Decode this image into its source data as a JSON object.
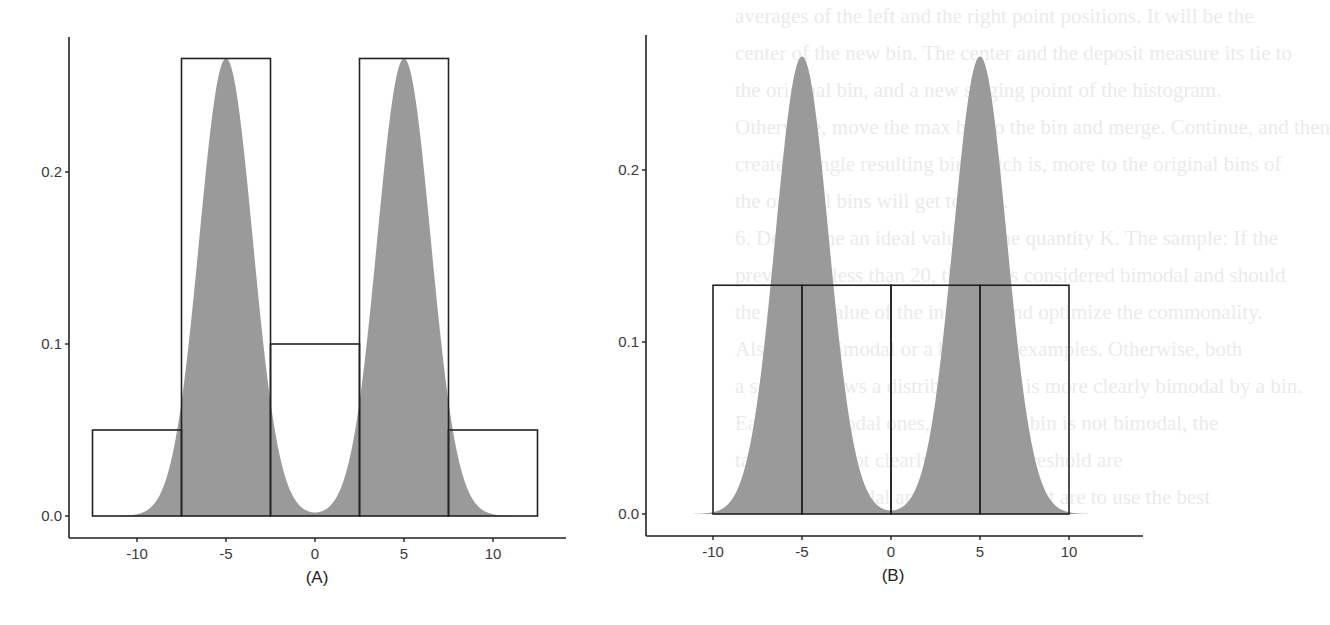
{
  "background_text": [
    "averages of the left and the right point positions. It will be the",
    "center of the new bin. The center and the deposit measure its tie to",
    "the original bin, and a new staging point of the histogram.",
    "Otherwise, move the max bin to the bin and merge. Continue, and then",
    "create a single resulting bin which is, more to the original bins of",
    "the original bins will get to zero.",
    "6.  Determine an ideal value of the quantity K. The sample: If the",
    "    prevalue is less than 20, the bin is considered bimodal and should",
    "    the modal value of the interval, and optimize the commonality.",
    "    Also, the unimodal or a bin of 11 examples. Otherwise, both",
    "    a section shows a distribution that is more clearly bimodal by a bin.",
    "    Earlier, unimodal ones, the overall bin is not bimodal, the",
    "    tails that are not clearly, then the threshold are",
    "    the bin, can modal approximation that are to use the best"
  ],
  "chart_data": [
    {
      "type": "area+histogram",
      "panel_label": "(A)",
      "description": "Bimodal density (two Gaussians at -5 and 5) overlaid with variable-width histogram bins",
      "xlabel": "",
      "ylabel": "",
      "x_ticks": [
        -10,
        -5,
        0,
        5,
        10
      ],
      "y_ticks": [
        "0.0",
        "0.1",
        "0.2"
      ],
      "xlim": [
        -13.5,
        14
      ],
      "ylim": [
        -0.013,
        0.278
      ],
      "grid": false,
      "density": {
        "modes": [
          -5,
          5
        ],
        "peak": 0.266,
        "sd": 1.5,
        "fill": "#9a9a9a"
      },
      "bins": [
        {
          "x0": -12.5,
          "x1": -7.5,
          "height": 0.05
        },
        {
          "x0": -7.5,
          "x1": -2.5,
          "height": 0.266
        },
        {
          "x0": -2.5,
          "x1": 2.5,
          "height": 0.1
        },
        {
          "x0": 2.5,
          "x1": 7.5,
          "height": 0.266
        },
        {
          "x0": 7.5,
          "x1": 12.5,
          "height": 0.05
        }
      ]
    },
    {
      "type": "area+histogram",
      "panel_label": "(B)",
      "description": "Same bimodal density overlaid with equal-width histogram bins",
      "xlabel": "",
      "ylabel": "",
      "x_ticks": [
        -10,
        -5,
        0,
        5,
        10
      ],
      "y_ticks": [
        "0.0",
        "0.1",
        "0.2"
      ],
      "xlim": [
        -13.5,
        14
      ],
      "ylim": [
        -0.013,
        0.278
      ],
      "grid": false,
      "density": {
        "modes": [
          -5,
          5
        ],
        "peak": 0.266,
        "sd": 1.5,
        "fill": "#9a9a9a"
      },
      "bins": [
        {
          "x0": -10,
          "x1": -5,
          "height": 0.133
        },
        {
          "x0": -5,
          "x1": 0,
          "height": 0.133
        },
        {
          "x0": 0,
          "x1": 5,
          "height": 0.133
        },
        {
          "x0": 5,
          "x1": 10,
          "height": 0.133
        }
      ]
    }
  ],
  "layout": {
    "panels": [
      {
        "yaxis_x": 69,
        "xaxis_y": 538,
        "y_top": 37,
        "x_end": 566,
        "x0_px": 315,
        "px_per_unit_x": 17.8,
        "y0_px": 516,
        "px_per_unit_y": 1720
      },
      {
        "yaxis_x": 646,
        "xaxis_y": 536,
        "y_top": 35,
        "x_end": 1143,
        "x0_px": 891,
        "px_per_unit_x": 17.8,
        "y0_px": 514,
        "px_per_unit_y": 1720
      }
    ]
  }
}
